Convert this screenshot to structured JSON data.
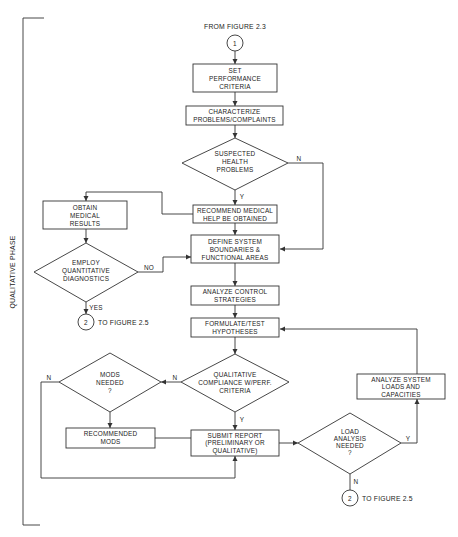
{
  "diagram": {
    "phase_label": "QUALITATIVE PHASE",
    "connectors": {
      "from_top": {
        "number": "1",
        "caption": "FROM FIGURE 2.3"
      },
      "to_left": {
        "number": "2",
        "caption": "TO FIGURE 2.5"
      },
      "to_bottom": {
        "number": "2",
        "caption": "TO FIGURE 2.5"
      }
    },
    "nodes": {
      "set_criteria": {
        "lines": [
          "SET",
          "PERFORMANCE",
          "CRITERIA"
        ]
      },
      "characterize": {
        "lines": [
          "CHARACTERIZE",
          "PROBLEMS/COMPLAINTS"
        ]
      },
      "suspected_health": {
        "lines": [
          "SUSPECTED",
          "HEALTH",
          "PROBLEMS"
        ]
      },
      "recommend_medical": {
        "lines": [
          "RECOMMEND MEDICAL",
          "HELP BE OBTAINED"
        ]
      },
      "obtain_results": {
        "lines": [
          "OBTAIN",
          "MEDICAL",
          "RESULTS"
        ]
      },
      "employ_quant": {
        "lines": [
          "EMPLOY",
          "QUANTITATIVE",
          "DIAGNOSTICS"
        ]
      },
      "define_system": {
        "lines": [
          "DEFINE SYSTEM",
          "BOUNDARIES &",
          "FUNCTIONAL AREAS"
        ]
      },
      "analyze_control": {
        "lines": [
          "ANALYZE CONTROL",
          "STRATEGIES"
        ]
      },
      "formulate_test": {
        "lines": [
          "FORMULATE/TEST",
          "HYPOTHESES"
        ]
      },
      "qual_compliance": {
        "lines": [
          "QUALITATIVE",
          "COMPLIANCE W/PERF.",
          "CRITERIA"
        ]
      },
      "mods_needed": {
        "lines": [
          "MODS",
          "NEEDED",
          "?"
        ]
      },
      "recommended_mods": {
        "lines": [
          "RECOMMENDED",
          "MODS"
        ]
      },
      "submit_report": {
        "lines": [
          "SUBMIT REPORT",
          "(PRELIMINARY OR",
          "QUALITATIVE)"
        ]
      },
      "load_analysis": {
        "lines": [
          "LOAD",
          "ANALYSIS",
          "NEEDED",
          "?"
        ]
      },
      "analyze_loads": {
        "lines": [
          "ANALYZE SYSTEM",
          "LOADS AND",
          "CAPACITIES"
        ]
      }
    },
    "edge_labels": {
      "suspected_n": "N",
      "suspected_y": "Y",
      "employ_no": "NO",
      "employ_yes": "YES",
      "compliance_n": "N",
      "compliance_y": "Y",
      "mods_n": "N",
      "load_y": "Y",
      "load_n": "N"
    }
  }
}
